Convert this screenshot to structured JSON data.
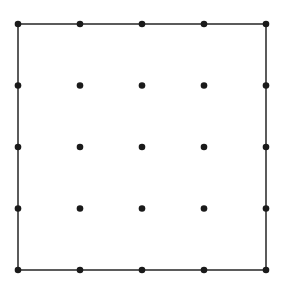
{
  "diagram": {
    "type": "dot-grid-square",
    "rows": 5,
    "cols": 5,
    "origin": [
      18,
      24
    ],
    "spacing": [
      62,
      61.5
    ],
    "dot_radius": 3.3,
    "line_width": 1.6,
    "colors": {
      "stroke": "#333333",
      "dot": "#1a1a1a",
      "background": "#ffffff"
    },
    "outline": "perimeter square connecting outer dots"
  }
}
